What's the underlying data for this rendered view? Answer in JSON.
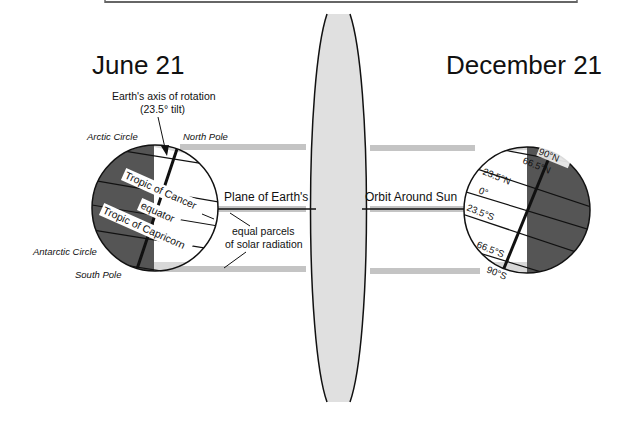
{
  "diagram": {
    "title_left": "June 21",
    "title_right": "December 21",
    "colors": {
      "night_side": "#555555",
      "day_side": "#ffffff",
      "orbit_plane_fill": "#e0e0e0",
      "radiation_band": "#c4c4c4",
      "line": "#111111"
    },
    "june": {
      "axis_label_line1": "Earth's axis of rotation",
      "axis_label_line2": "(23.5° tilt)",
      "arctic_circle": "Arctic Circle",
      "north_pole": "North Pole",
      "tropic_cancer": "Tropic of Cancer",
      "equator": "equator",
      "tropic_capricorn": "Tropic of Capricorn",
      "antarctic_circle": "Antarctic Circle",
      "south_pole": "South Pole"
    },
    "center": {
      "plane_label": "Plane of Earth's",
      "orbit_label": "Orbit Around Sun",
      "parcels_line1": "equal parcels",
      "parcels_line2": "of solar radiation"
    },
    "december": {
      "lat_90n": "90°N",
      "lat_665n": "66.5°N",
      "lat_235n": "23.5°N",
      "lat_0": "0°",
      "lat_235s": "23.5°S",
      "lat_665s": "66.5°S",
      "lat_90s": "90°S"
    }
  }
}
